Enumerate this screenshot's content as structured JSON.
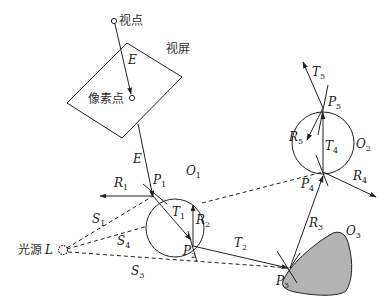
{
  "diagram": {
    "labels": {
      "viewpoint": "视点",
      "screen": "视屏",
      "pixel": "像素点",
      "light_source": "光源",
      "light_symbol": "L"
    },
    "rays": [
      {
        "id": "E",
        "main": "E",
        "sub": ""
      },
      {
        "id": "E2",
        "main": "E",
        "sub": ""
      },
      {
        "id": "R1",
        "main": "R",
        "sub": "1"
      },
      {
        "id": "T1",
        "main": "T",
        "sub": "1"
      },
      {
        "id": "R2",
        "main": "R",
        "sub": "2"
      },
      {
        "id": "T2",
        "main": "T",
        "sub": "2"
      },
      {
        "id": "R3",
        "main": "R",
        "sub": "3"
      },
      {
        "id": "R4",
        "main": "R",
        "sub": "4"
      },
      {
        "id": "T4",
        "main": "T",
        "sub": "4"
      },
      {
        "id": "R5",
        "main": "R",
        "sub": "5"
      },
      {
        "id": "T5",
        "main": "T",
        "sub": "5"
      },
      {
        "id": "S1",
        "main": "S",
        "sub": "1"
      },
      {
        "id": "S3",
        "main": "S",
        "sub": "3"
      },
      {
        "id": "S4",
        "main": "S",
        "sub": "4"
      }
    ],
    "points": [
      {
        "id": "P1",
        "main": "P",
        "sub": "1"
      },
      {
        "id": "P2",
        "main": "P",
        "sub": "2"
      },
      {
        "id": "P3",
        "main": "P",
        "sub": "3"
      },
      {
        "id": "P4",
        "main": "P",
        "sub": "4"
      },
      {
        "id": "P5",
        "main": "P",
        "sub": "5"
      }
    ],
    "objects": [
      {
        "id": "O1",
        "main": "O",
        "sub": "1"
      },
      {
        "id": "O2",
        "main": "O",
        "sub": "2"
      },
      {
        "id": "O3",
        "main": "O",
        "sub": "3"
      }
    ],
    "colors": {
      "stroke": "#222222",
      "object3_fill": "#b3b3b3"
    }
  }
}
